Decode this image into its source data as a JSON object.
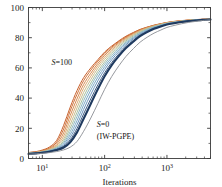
{
  "chart_data": {
    "type": "line",
    "title": "",
    "xlabel": "Iterations",
    "ylabel": "",
    "xscale": "log",
    "xlim": [
      6,
      5000
    ],
    "ylim": [
      0,
      100
    ],
    "grid": false,
    "legend_position": "none",
    "xticks": [
      {
        "value": 10,
        "label": "10",
        "exp": "1"
      },
      {
        "value": 100,
        "label": "10",
        "exp": "2"
      },
      {
        "value": 1000,
        "label": "10",
        "exp": "3"
      }
    ],
    "yticks": [
      0,
      20,
      40,
      60,
      80,
      100
    ],
    "annotations": [
      {
        "name": "s100-label",
        "text": "S=100",
        "italic_prefix": "S",
        "rest": "=100",
        "x": 14,
        "y": 62
      },
      {
        "name": "s0-label",
        "text": "S=0",
        "italic_prefix": "S",
        "rest": "=0",
        "x": 75,
        "y": 21
      },
      {
        "name": "iwpgpe-label",
        "text": "(IW-PGPE)",
        "x": 75,
        "y": 13
      }
    ],
    "series": [
      {
        "name": "S=100",
        "color": "#c8622e",
        "width": 1.0,
        "x": [
          6,
          8,
          10,
          13,
          17,
          22,
          28,
          36,
          46,
          60,
          78,
          100,
          130,
          170,
          220,
          290,
          370,
          480,
          620,
          800,
          1000,
          1300,
          1700,
          2200,
          2900,
          3700,
          5000
        ],
        "values": [
          4.0,
          4.6,
          5.6,
          7.6,
          12.0,
          22.0,
          34.0,
          45.0,
          53.5,
          60.0,
          65.5,
          70.5,
          74.5,
          78.0,
          81.0,
          83.5,
          85.5,
          87.0,
          88.3,
          89.3,
          90.1,
          90.8,
          91.3,
          91.7,
          92.0,
          92.2,
          92.4
        ]
      },
      {
        "name": "S=90",
        "color": "#cf7038",
        "width": 1.0,
        "x": [
          6,
          8,
          10,
          13,
          17,
          22,
          28,
          36,
          46,
          60,
          78,
          100,
          130,
          170,
          220,
          290,
          370,
          480,
          620,
          800,
          1000,
          1300,
          1700,
          2200,
          2900,
          3700,
          5000
        ],
        "values": [
          3.9,
          4.4,
          5.3,
          7.0,
          10.8,
          19.5,
          31.5,
          42.5,
          51.5,
          58.5,
          64.5,
          69.5,
          73.8,
          77.5,
          80.5,
          83.2,
          85.3,
          86.9,
          88.2,
          89.2,
          90.0,
          90.7,
          91.2,
          91.6,
          91.9,
          92.2,
          92.4
        ]
      },
      {
        "name": "S=80",
        "color": "#d68a50",
        "width": 1.0,
        "x": [
          6,
          8,
          10,
          13,
          17,
          22,
          28,
          36,
          46,
          60,
          78,
          100,
          130,
          170,
          220,
          290,
          370,
          480,
          620,
          800,
          1000,
          1300,
          1700,
          2200,
          2900,
          3700,
          5000
        ],
        "values": [
          3.8,
          4.2,
          5.0,
          6.5,
          9.6,
          17.0,
          28.5,
          39.5,
          49.0,
          56.5,
          63.0,
          68.3,
          72.9,
          76.8,
          80.0,
          82.8,
          85.0,
          86.7,
          88.0,
          89.1,
          89.9,
          90.6,
          91.2,
          91.6,
          91.9,
          92.1,
          92.3
        ]
      },
      {
        "name": "S=70",
        "color": "#ddab74",
        "width": 1.0,
        "x": [
          6,
          8,
          10,
          13,
          17,
          22,
          28,
          36,
          46,
          60,
          78,
          100,
          130,
          170,
          220,
          290,
          370,
          480,
          620,
          800,
          1000,
          1300,
          1700,
          2200,
          2900,
          3700,
          5000
        ],
        "values": [
          3.7,
          4.1,
          4.8,
          6.1,
          8.7,
          14.8,
          25.5,
          36.5,
          46.5,
          54.5,
          61.5,
          67.0,
          71.9,
          76.0,
          79.4,
          82.3,
          84.6,
          86.4,
          87.8,
          88.9,
          89.8,
          90.5,
          91.1,
          91.5,
          91.8,
          92.1,
          92.3
        ]
      },
      {
        "name": "S=60",
        "color": "#c8bd8e",
        "width": 1.0,
        "x": [
          6,
          8,
          10,
          13,
          17,
          22,
          28,
          36,
          46,
          60,
          78,
          100,
          130,
          170,
          220,
          290,
          370,
          480,
          620,
          800,
          1000,
          1300,
          1700,
          2200,
          2900,
          3700,
          5000
        ],
        "values": [
          3.6,
          4.0,
          4.6,
          5.8,
          8.0,
          13.0,
          22.5,
          33.5,
          43.8,
          52.3,
          59.8,
          65.6,
          70.8,
          75.1,
          78.7,
          81.8,
          84.2,
          86.1,
          87.6,
          88.8,
          89.7,
          90.4,
          91.0,
          91.5,
          91.8,
          92.0,
          92.3
        ]
      },
      {
        "name": "S=50",
        "color": "#a9c1a0",
        "width": 1.0,
        "x": [
          6,
          8,
          10,
          13,
          17,
          22,
          28,
          36,
          46,
          60,
          78,
          100,
          130,
          170,
          220,
          290,
          370,
          480,
          620,
          800,
          1000,
          1300,
          1700,
          2200,
          2900,
          3700,
          5000
        ],
        "values": [
          3.5,
          3.9,
          4.5,
          5.5,
          7.5,
          11.6,
          20.0,
          30.5,
          41.0,
          50.0,
          57.8,
          64.0,
          69.5,
          74.1,
          77.9,
          81.2,
          83.7,
          85.8,
          87.3,
          88.6,
          89.5,
          90.3,
          90.9,
          91.4,
          91.8,
          92.0,
          92.2
        ]
      },
      {
        "name": "S=40",
        "color": "#8fb8c3",
        "width": 1.0,
        "x": [
          6,
          8,
          10,
          13,
          17,
          22,
          28,
          36,
          46,
          60,
          78,
          100,
          130,
          170,
          220,
          290,
          370,
          480,
          620,
          800,
          1000,
          1300,
          1700,
          2200,
          2900,
          3700,
          5000
        ],
        "values": [
          3.4,
          3.8,
          4.3,
          5.3,
          7.0,
          10.5,
          17.8,
          27.8,
          38.3,
          47.8,
          56.0,
          62.5,
          68.2,
          73.0,
          77.0,
          80.5,
          83.2,
          85.4,
          87.1,
          88.4,
          89.4,
          90.2,
          90.8,
          91.3,
          91.7,
          92.0,
          92.2
        ]
      },
      {
        "name": "S=30",
        "color": "#7aa9c6",
        "width": 1.0,
        "x": [
          6,
          8,
          10,
          13,
          17,
          22,
          28,
          36,
          46,
          60,
          78,
          100,
          130,
          170,
          220,
          290,
          370,
          480,
          620,
          800,
          1000,
          1300,
          1700,
          2200,
          2900,
          3700,
          5000
        ],
        "values": [
          3.3,
          3.7,
          4.2,
          5.1,
          6.6,
          9.6,
          15.8,
          25.0,
          35.5,
          45.3,
          53.9,
          60.8,
          66.9,
          72.0,
          76.2,
          79.9,
          82.7,
          85.0,
          86.8,
          88.2,
          89.2,
          90.1,
          90.7,
          91.2,
          91.6,
          91.9,
          92.2
        ]
      },
      {
        "name": "S=20",
        "color": "#6b93bd",
        "width": 1.0,
        "x": [
          6,
          8,
          10,
          13,
          17,
          22,
          28,
          36,
          46,
          60,
          78,
          100,
          130,
          170,
          220,
          290,
          370,
          480,
          620,
          800,
          1000,
          1300,
          1700,
          2200,
          2900,
          3700,
          5000
        ],
        "values": [
          3.2,
          3.6,
          4.1,
          4.9,
          6.3,
          8.8,
          14.0,
          22.3,
          32.5,
          42.5,
          51.5,
          58.9,
          65.4,
          70.8,
          75.3,
          79.2,
          82.2,
          84.6,
          86.5,
          87.9,
          89.0,
          89.9,
          90.6,
          91.1,
          91.6,
          91.9,
          92.1
        ]
      },
      {
        "name": "S=10",
        "color": "#3d5a80",
        "width": 1.0,
        "x": [
          6,
          8,
          10,
          13,
          17,
          22,
          28,
          36,
          46,
          60,
          78,
          100,
          130,
          170,
          220,
          290,
          370,
          480,
          620,
          800,
          1000,
          1300,
          1700,
          2200,
          2900,
          3700,
          5000
        ],
        "values": [
          3.1,
          3.5,
          4.0,
          4.7,
          6.0,
          8.1,
          12.4,
          19.8,
          29.5,
          39.5,
          48.8,
          56.7,
          63.6,
          69.4,
          74.2,
          78.3,
          81.6,
          84.1,
          86.2,
          87.7,
          88.8,
          89.7,
          90.5,
          91.0,
          91.5,
          91.8,
          92.1
        ]
      },
      {
        "name": "S=0",
        "color": "#1f3a5f",
        "width": 2.1,
        "x": [
          6,
          8,
          10,
          13,
          17,
          22,
          28,
          36,
          46,
          60,
          78,
          100,
          130,
          170,
          220,
          290,
          370,
          480,
          620,
          800,
          1000,
          1300,
          1700,
          2200,
          2900,
          3700,
          5000
        ],
        "values": [
          3.0,
          3.4,
          3.8,
          4.5,
          5.6,
          7.3,
          10.8,
          17.3,
          26.3,
          36.3,
          46.0,
          54.5,
          61.9,
          68.0,
          73.1,
          77.5,
          81.0,
          83.7,
          85.9,
          87.5,
          88.7,
          89.6,
          90.4,
          91.0,
          91.4,
          91.8,
          92.1
        ]
      },
      {
        "name": "S=0-outer",
        "color": "#8a8d93",
        "width": 0.9,
        "x": [
          6,
          8,
          10,
          13,
          17,
          22,
          28,
          36,
          46,
          60,
          78,
          100,
          130,
          170,
          220,
          290,
          370,
          480,
          620,
          800,
          1000,
          1300,
          1700,
          2200,
          2900,
          3700,
          5000
        ],
        "values": [
          2.8,
          3.1,
          3.4,
          3.9,
          4.6,
          5.7,
          7.5,
          11.3,
          18.0,
          26.8,
          36.5,
          45.8,
          54.3,
          61.5,
          67.6,
          72.8,
          77.0,
          80.3,
          83.0,
          85.1,
          86.8,
          88.1,
          89.2,
          90.1,
          90.8,
          91.4,
          91.9
        ]
      }
    ]
  },
  "axis": {
    "y_tick_labels": [
      "0",
      "20",
      "40",
      "60",
      "80",
      "100"
    ],
    "x_tick_mantissa": "10"
  }
}
